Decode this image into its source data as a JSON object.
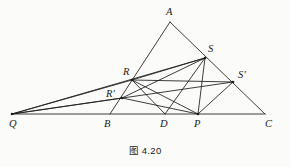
{
  "figure": {
    "caption": "图 4.20",
    "background_color": "#fbfbfa",
    "line_color": "#1b1b1b",
    "label_color": "#1a1a1a"
  },
  "points": {
    "A": {
      "label": "A",
      "x": 170,
      "y": 22,
      "label_x": 166,
      "label_y": 7
    },
    "Q": {
      "label": "Q",
      "x": 12,
      "y": 114,
      "label_x": 9,
      "label_y": 119
    },
    "C": {
      "label": "C",
      "x": 265,
      "y": 114,
      "label_x": 265,
      "label_y": 119
    },
    "B": {
      "label": "B",
      "x": 110,
      "y": 114,
      "label_x": 104,
      "label_y": 119
    },
    "D": {
      "label": "D",
      "x": 165,
      "y": 114,
      "label_x": 160,
      "label_y": 119
    },
    "P": {
      "label": "P",
      "x": 198,
      "y": 114,
      "label_x": 194,
      "label_y": 119
    },
    "R": {
      "label": "R",
      "x": 132,
      "y": 80,
      "label_x": 123,
      "label_y": 67
    },
    "R_prime": {
      "label": "R'",
      "x": 122,
      "y": 98,
      "label_x": 106,
      "label_y": 89
    },
    "S": {
      "label": "S",
      "x": 205,
      "y": 58,
      "label_x": 208,
      "label_y": 44
    },
    "S_prime": {
      "label": "S'",
      "x": 233,
      "y": 82,
      "label_x": 238,
      "label_y": 70
    }
  },
  "segments": [
    {
      "name": "base-QC",
      "from": "Q",
      "to": "C"
    },
    {
      "name": "side-AQ",
      "from": "A",
      "to": "B"
    },
    {
      "name": "side-AC",
      "from": "A",
      "to": "C"
    },
    {
      "name": "cevian-QS",
      "from": "Q",
      "to": "S"
    },
    {
      "name": "cevian-QSp",
      "from": "Q",
      "to": "S_prime"
    },
    {
      "name": "ray-QR",
      "from": "Q",
      "to": "R"
    },
    {
      "name": "ray-QRp",
      "from": "Q",
      "to": "R_prime"
    },
    {
      "name": "seg-RP",
      "from": "R",
      "to": "P"
    },
    {
      "name": "seg-RD",
      "from": "R",
      "to": "D"
    },
    {
      "name": "seg-RSp",
      "from": "R",
      "to": "S_prime"
    },
    {
      "name": "seg-RpP",
      "from": "R_prime",
      "to": "P"
    },
    {
      "name": "seg-RpS",
      "from": "R_prime",
      "to": "S"
    },
    {
      "name": "seg-SP",
      "from": "S",
      "to": "P"
    },
    {
      "name": "seg-SD",
      "from": "S",
      "to": "D"
    },
    {
      "name": "seg-SpP",
      "from": "S_prime",
      "to": "P"
    },
    {
      "name": "seg-RS",
      "from": "R",
      "to": "S"
    }
  ],
  "vertex_dots": [
    "R",
    "R_prime",
    "S",
    "S_prime",
    "P",
    "Q"
  ]
}
